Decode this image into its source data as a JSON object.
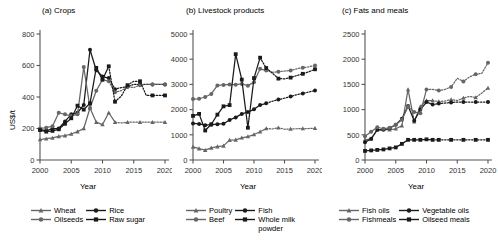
{
  "figure": {
    "width": 498,
    "height": 241,
    "xlabel": "Year",
    "ylabel": "US$/t",
    "colors": {
      "dark": "#1a1a1a",
      "gray": "#666666",
      "axis": "#555555",
      "background": "#ffffff"
    }
  },
  "chart_data": [
    {
      "type": "line",
      "panel": "a",
      "title": "(a) Crops",
      "xlabel": "Year",
      "ylabel": "US$/t",
      "xlim": [
        2000,
        2020
      ],
      "ylim": [
        0,
        800
      ],
      "xticks": [
        2000,
        2005,
        2010,
        2015,
        2020
      ],
      "yticks": [
        0,
        200,
        400,
        600,
        800
      ],
      "grid": false,
      "legend_position": "below",
      "x": [
        2000,
        2001,
        2002,
        2003,
        2004,
        2005,
        2006,
        2007,
        2008,
        2009,
        2010,
        2011,
        2012,
        2013,
        2014,
        2015,
        2016,
        2017,
        2018,
        2019,
        2020
      ],
      "series": [
        {
          "name": "Wheat",
          "marker": "triangle",
          "color": "#666666",
          "values": [
            130,
            135,
            140,
            150,
            155,
            165,
            180,
            200,
            330,
            240,
            225,
            300,
            240,
            235,
            240,
            240,
            240,
            240,
            240,
            240,
            240
          ],
          "dashed_from": 2012
        },
        {
          "name": "Rice",
          "marker": "circle",
          "color": "#1a1a1a",
          "values": [
            195,
            185,
            200,
            200,
            245,
            290,
            300,
            350,
            700,
            570,
            530,
            520,
            450,
            460,
            465,
            480,
            480,
            480,
            480,
            480,
            480
          ],
          "dashed_from": 2011
        },
        {
          "name": "Oilseeds",
          "marker": "circle",
          "color": "#666666",
          "values": [
            200,
            205,
            215,
            300,
            290,
            280,
            290,
            590,
            330,
            440,
            510,
            500,
            430,
            440,
            465,
            460,
            475,
            480,
            480,
            480,
            480
          ],
          "dashed_from": 2011
        },
        {
          "name": "Raw sugar",
          "marker": "square",
          "color": "#1a1a1a",
          "values": [
            190,
            180,
            185,
            195,
            230,
            265,
            345,
            320,
            360,
            585,
            510,
            595,
            370,
            405,
            475,
            500,
            500,
            410,
            410,
            410,
            410
          ],
          "dashed_from": 2011
        }
      ]
    },
    {
      "type": "line",
      "panel": "b",
      "title": "(b) Livestock products",
      "xlabel": "Year",
      "ylabel": "US$/t",
      "xlim": [
        2000,
        2020
      ],
      "ylim": [
        0,
        5000
      ],
      "xticks": [
        2000,
        2005,
        2010,
        2015,
        2020
      ],
      "yticks": [
        0,
        1000,
        2000,
        3000,
        4000,
        5000
      ],
      "grid": false,
      "legend_position": "below",
      "x": [
        2000,
        2001,
        2002,
        2003,
        2004,
        2005,
        2006,
        2007,
        2008,
        2009,
        2010,
        2011,
        2012,
        2013,
        2014,
        2015,
        2016,
        2017,
        2018,
        2019,
        2020
      ],
      "series": [
        {
          "name": "Poultry",
          "marker": "triangle",
          "color": "#666666",
          "values": [
            520,
            450,
            390,
            480,
            530,
            560,
            790,
            800,
            880,
            930,
            1010,
            1120,
            1250,
            1230,
            1280,
            1220,
            1230,
            1240,
            1250,
            1250,
            1260
          ],
          "dashed_from": 2012
        },
        {
          "name": "Fish",
          "marker": "circle",
          "color": "#1a1a1a",
          "values": [
            1450,
            1430,
            1380,
            1400,
            1420,
            1440,
            1590,
            1690,
            1830,
            1900,
            2010,
            2180,
            2250,
            2330,
            2400,
            2450,
            2520,
            2590,
            2640,
            2700,
            2760
          ],
          "dashed_from": 2012
        },
        {
          "name": "Beef",
          "marker": "circle",
          "color": "#666666",
          "values": [
            2420,
            2430,
            2500,
            2620,
            2960,
            2980,
            3000,
            2990,
            3020,
            2950,
            3090,
            3620,
            3550,
            3480,
            3500,
            3530,
            3550,
            3620,
            3660,
            3700,
            3750
          ],
          "dashed_from": 2012
        },
        {
          "name": "Whole milk powder",
          "marker": "square",
          "color": "#1a1a1a",
          "values": [
            1750,
            1830,
            1170,
            1420,
            1800,
            2130,
            2180,
            4200,
            3190,
            1280,
            3250,
            4060,
            3650,
            3450,
            3230,
            3220,
            3270,
            3350,
            3420,
            3500,
            3600
          ],
          "dashed_from": 2011
        }
      ]
    },
    {
      "type": "line",
      "panel": "c",
      "title": "(c) Fats and meals",
      "xlabel": "Year",
      "ylabel": "US$/t",
      "xlim": [
        2000,
        2020
      ],
      "ylim": [
        0,
        2500
      ],
      "xticks": [
        2000,
        2005,
        2010,
        2015,
        2020
      ],
      "yticks": [
        0,
        500,
        1000,
        1500,
        2000,
        2500
      ],
      "grid": false,
      "legend_position": "below",
      "x": [
        2000,
        2001,
        2002,
        2003,
        2004,
        2005,
        2006,
        2007,
        2008,
        2009,
        2010,
        2011,
        2012,
        2013,
        2014,
        2015,
        2016,
        2017,
        2018,
        2019,
        2020
      ],
      "series": [
        {
          "name": "Fish oils",
          "marker": "triangle",
          "color": "#666666",
          "values": [
            400,
            420,
            600,
            610,
            600,
            620,
            680,
            1400,
            760,
            1060,
            1180,
            1180,
            1160,
            1170,
            1200,
            1180,
            1230,
            1260,
            1240,
            1330,
            1430
          ],
          "dashed_from": 2011
        },
        {
          "name": "Vegetable oils",
          "marker": "circle",
          "color": "#1a1a1a",
          "values": [
            350,
            420,
            600,
            600,
            630,
            700,
            820,
            1070,
            780,
            1000,
            1150,
            1100,
            1120,
            1130,
            1140,
            1150,
            1150,
            1150,
            1150,
            1150,
            1150
          ],
          "dashed_from": 2011
        },
        {
          "name": "Fishmeals",
          "marker": "circle",
          "color": "#666666",
          "values": [
            470,
            560,
            650,
            620,
            640,
            700,
            800,
            1060,
            950,
            930,
            1400,
            1400,
            1380,
            1400,
            1450,
            1620,
            1560,
            1650,
            1700,
            1720,
            1930
          ],
          "dashed_from": 2010
        },
        {
          "name": "Oilseed meals",
          "marker": "square",
          "color": "#1a1a1a",
          "values": [
            180,
            190,
            200,
            210,
            230,
            250,
            320,
            400,
            400,
            400,
            410,
            400,
            400,
            400,
            400,
            400,
            400,
            400,
            400,
            400,
            400
          ],
          "dashed_from": 2011
        }
      ]
    }
  ],
  "legends": [
    {
      "panel": "a",
      "entries": [
        {
          "label": "Wheat",
          "marker": "triangle",
          "color": "#666666"
        },
        {
          "label": "Oilseeds",
          "marker": "circle",
          "color": "#666666"
        },
        {
          "label": "Rice",
          "marker": "circle",
          "color": "#1a1a1a"
        },
        {
          "label": "Raw sugar",
          "marker": "square",
          "color": "#1a1a1a"
        }
      ]
    },
    {
      "panel": "b",
      "entries": [
        {
          "label": "Poultry",
          "marker": "triangle",
          "color": "#666666"
        },
        {
          "label": "Beef",
          "marker": "circle",
          "color": "#666666"
        },
        {
          "label": "Fish",
          "marker": "circle",
          "color": "#1a1a1a"
        },
        {
          "label": "Whole milk\npowder",
          "marker": "square",
          "color": "#1a1a1a"
        }
      ]
    },
    {
      "panel": "c",
      "entries": [
        {
          "label": "Fish oils",
          "marker": "triangle",
          "color": "#666666"
        },
        {
          "label": "Fishmeals",
          "marker": "circle",
          "color": "#666666"
        },
        {
          "label": "Vegetable oils",
          "marker": "circle",
          "color": "#1a1a1a"
        },
        {
          "label": "Oilseed meals",
          "marker": "square",
          "color": "#1a1a1a"
        }
      ]
    }
  ]
}
